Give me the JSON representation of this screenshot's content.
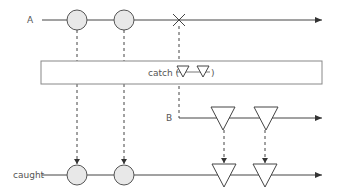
{
  "diagram": {
    "type": "marble-diagram",
    "operator": "catch",
    "colors": {
      "line": "#444444",
      "marble_fill": "#e8e8e8",
      "marble_stroke": "#555555",
      "box_stroke": "#888888",
      "text": "#555555"
    },
    "streams": {
      "a": {
        "label": "A",
        "y": 20,
        "x_start": 42,
        "x_end": 322,
        "marbles": [
          {
            "shape": "circle",
            "x": 77
          },
          {
            "shape": "circle",
            "x": 124
          }
        ],
        "error_at_x": 179
      },
      "b": {
        "label": "B",
        "y": 118,
        "x_start": 179,
        "x_end": 322,
        "marbles": [
          {
            "shape": "triangle",
            "x": 223
          },
          {
            "shape": "triangle",
            "x": 266
          }
        ]
      },
      "caught": {
        "label": "caught",
        "y": 175,
        "x_start": 42,
        "x_end": 322,
        "marbles": [
          {
            "shape": "circle",
            "x": 77
          },
          {
            "shape": "circle",
            "x": 124
          },
          {
            "shape": "triangle",
            "x": 224
          },
          {
            "shape": "triangle",
            "x": 265
          }
        ]
      }
    },
    "operator_box": {
      "text_prefix": "catch (",
      "text_suffix": ")",
      "x": 41,
      "y": 61,
      "width": 281,
      "height": 23
    }
  }
}
